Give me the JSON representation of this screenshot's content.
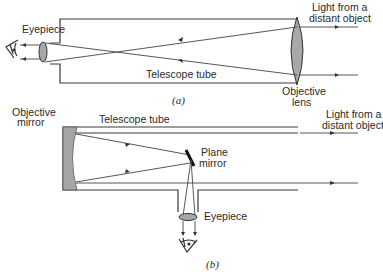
{
  "figure": {
    "panel_a": {
      "caption": "(a)",
      "labels": {
        "eyepiece": "Eyepiece",
        "telescope_tube": "Telescope tube",
        "objective_lens_line1": "Objective",
        "objective_lens_line2": "lens",
        "light_line1": "Light from a",
        "light_line2": "distant object"
      },
      "components": [
        "eye-icon",
        "eyepiece-lens",
        "telescope-tube",
        "objective-lens",
        "incoming-rays",
        "converging-rays"
      ]
    },
    "panel_b": {
      "caption": "(b)",
      "labels": {
        "objective_mirror_line1": "Objective",
        "objective_mirror_line2": "mirror",
        "telescope_tube": "Telescope tube",
        "plane_mirror_line1": "Plane",
        "plane_mirror_line2": "mirror",
        "eyepiece": "Eyepiece",
        "light_line1": "Light from a",
        "light_line2": "distant object"
      },
      "components": [
        "objective-mirror",
        "telescope-tube",
        "plane-mirror",
        "eyepiece-tube",
        "eyepiece-lens",
        "eye-icon",
        "incoming-rays",
        "reflected-rays"
      ]
    }
  }
}
